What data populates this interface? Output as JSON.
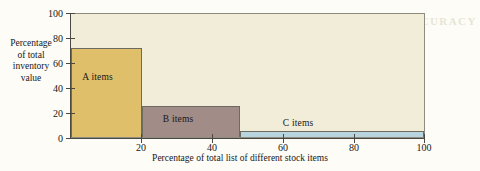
{
  "chart_data": {
    "type": "bar",
    "title": "",
    "xlabel": "Percentage of total list of different stock items",
    "ylabel": "Percentage of total inventory value",
    "xlim": [
      0,
      100
    ],
    "ylim": [
      0,
      100
    ],
    "grid": false,
    "legend": "none (bars labeled in place)",
    "xticks": [
      20,
      40,
      60,
      80,
      100
    ],
    "yticks": [
      0,
      20,
      40,
      60,
      80,
      100
    ],
    "categories": [
      "A items",
      "B items",
      "C items"
    ],
    "bars": [
      {
        "label": "A items",
        "x_start": 0,
        "x_end": 20,
        "value": 72,
        "color": "#E0BF6A"
      },
      {
        "label": "B items",
        "x_start": 20,
        "x_end": 48,
        "value": 25,
        "color": "#A28C87"
      },
      {
        "label": "C items",
        "x_start": 48,
        "x_end": 100,
        "value": 5,
        "color": "#B8D4DE"
      }
    ],
    "values": [
      72,
      25,
      5
    ],
    "plot_background": "#F2EDD8",
    "axis_color": "#4A4843"
  },
  "axes": {
    "y_title_lines": [
      "Percentage",
      "of total",
      "inventory",
      "value"
    ],
    "x_title": "Percentage of total list of different stock items",
    "y_tick_labels": [
      "100",
      "80",
      "60",
      "40",
      "20",
      "0"
    ],
    "x_tick_labels": [
      "20",
      "40",
      "60",
      "80",
      "100"
    ]
  },
  "bar_labels": {
    "a": "A items",
    "b": "B items",
    "c": "C items"
  },
  "artifacts": {
    "show_through_text": "INVENTORY PLANNING AND ACCURACY"
  }
}
